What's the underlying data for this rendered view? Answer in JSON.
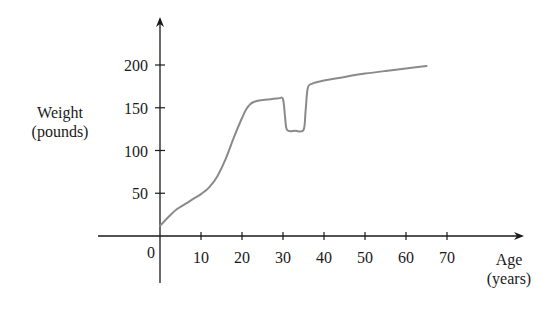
{
  "chart_data": {
    "type": "line",
    "title": "",
    "xlabel": "Age (years)",
    "ylabel": "Weight (pounds)",
    "xlabel_lines": [
      "Age",
      "(years)"
    ],
    "ylabel_lines": [
      "Weight",
      "(pounds)"
    ],
    "origin_label": "0",
    "x_ticks": [
      10,
      20,
      30,
      40,
      50,
      60,
      70
    ],
    "y_ticks": [
      50,
      100,
      150,
      200
    ],
    "xlim": [
      -15,
      88
    ],
    "ylim": [
      -55,
      255
    ],
    "grid": false,
    "legend": null,
    "line_color": "#8a8a8a",
    "axis_color": "#1a1a1a",
    "series": [
      {
        "name": "Weight",
        "x": [
          0,
          2,
          4,
          6,
          8,
          10,
          12,
          14,
          16,
          18,
          20,
          21,
          22,
          23,
          25,
          27,
          29,
          30,
          30.5,
          31,
          33,
          35,
          35.5,
          36,
          37,
          40,
          45,
          50,
          55,
          60,
          65
        ],
        "y": [
          12,
          22,
          31,
          37,
          43,
          49,
          57,
          70,
          90,
          115,
          138,
          148,
          154,
          157,
          159,
          160,
          161,
          160,
          140,
          124,
          123,
          124,
          145,
          172,
          178,
          182,
          186,
          190,
          193,
          196,
          199
        ]
      }
    ]
  }
}
